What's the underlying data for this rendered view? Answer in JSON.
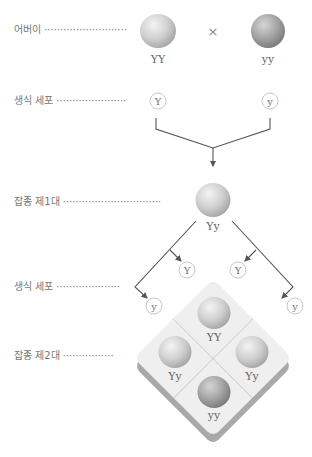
{
  "labels": {
    "parents": "어버이 ··························",
    "gametes_p": "생식 세포 ······················",
    "f1": "잡종 제1대 ·······························",
    "gametes_f1": "생식 세포 ····················",
    "f2": "잡종 제2대 ················"
  },
  "parents": {
    "left_genotype": "YY",
    "right_genotype": "yy",
    "cross_symbol": "×"
  },
  "parent_gametes": {
    "left": "Y",
    "right": "y"
  },
  "f1": {
    "genotype": "Yy"
  },
  "f1_gametes": {
    "inner_left": "Y",
    "inner_right": "Y",
    "outer_left": "y",
    "outer_right": "y"
  },
  "f2": {
    "top": "YY",
    "left": "Yy",
    "right": "Yy",
    "bottom": "yy"
  },
  "colors": {
    "line": "#555555",
    "label_text": "#777777",
    "gamete_border": "#c8c8c8",
    "board_face": "#efefef",
    "board_shadow": "#a9a9a9"
  }
}
